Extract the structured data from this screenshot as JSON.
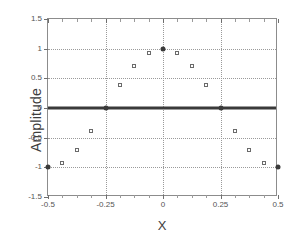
{
  "chart_data": {
    "type": "scatter",
    "title": "",
    "xlabel": "X",
    "ylabel": "Amplitude",
    "xlim": [
      -0.5,
      0.5
    ],
    "ylim": [
      -1.5,
      1.5
    ],
    "grid": true,
    "legend": "none",
    "x_ticks": [
      -0.5,
      -0.25,
      0,
      0.25,
      0.5
    ],
    "x_tick_labels": [
      "-0.5",
      "-0.25",
      "0",
      "0.25",
      "0.5"
    ],
    "y_ticks": [
      -1.5,
      -1,
      -0.5,
      0,
      0.5,
      1,
      1.5
    ],
    "y_tick_labels": [
      "-1.5",
      "-1",
      "-0.5",
      "0",
      "0.5",
      "1",
      "1.5"
    ],
    "x_minor_ticks": [
      -0.4375,
      -0.375,
      -0.3125,
      -0.1875,
      -0.125,
      -0.0625,
      0.0625,
      0.125,
      0.1875,
      0.3125,
      0.375,
      0.4375
    ],
    "series": [
      {
        "name": "samples",
        "marker": "open-square",
        "color": "#6a6a6a",
        "points": [
          {
            "x": -0.4375,
            "y": -0.924
          },
          {
            "x": -0.375,
            "y": -0.707
          },
          {
            "x": -0.3125,
            "y": -0.383
          },
          {
            "x": -0.1875,
            "y": 0.383
          },
          {
            "x": -0.125,
            "y": 0.707
          },
          {
            "x": -0.0625,
            "y": 0.924
          },
          {
            "x": 0.0625,
            "y": 0.924
          },
          {
            "x": 0.125,
            "y": 0.707
          },
          {
            "x": 0.1875,
            "y": 0.383
          },
          {
            "x": 0.3125,
            "y": -0.383
          },
          {
            "x": 0.375,
            "y": -0.707
          },
          {
            "x": 0.4375,
            "y": -0.924
          }
        ]
      },
      {
        "name": "nodes",
        "marker": "filled-circle",
        "color": "#3a3a3a",
        "points": [
          {
            "x": -0.5,
            "y": -1
          },
          {
            "x": -0.25,
            "y": 0
          },
          {
            "x": 0,
            "y": 1
          },
          {
            "x": 0.25,
            "y": 0
          },
          {
            "x": 0.5,
            "y": -1
          }
        ]
      }
    ],
    "reference_line": {
      "name": "zero-line",
      "orientation": "horizontal",
      "y": 0,
      "color": "#3a3a3a",
      "width_px": 3
    }
  }
}
